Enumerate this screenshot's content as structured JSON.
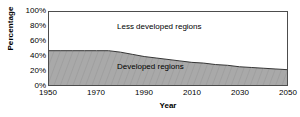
{
  "chart_data": {
    "type": "area",
    "title": "",
    "subtitle": "",
    "xlabel": "Year",
    "ylabel": "Percentage",
    "xlim": [
      1950,
      2050
    ],
    "ylim": [
      0,
      100
    ],
    "grid": false,
    "legend_position": "inside-plot-annotations",
    "stacked": true,
    "x": [
      1950,
      1955,
      1960,
      1965,
      1970,
      1975,
      1980,
      1985,
      1990,
      1995,
      2000,
      2005,
      2010,
      2015,
      2020,
      2025,
      2030,
      2035,
      2040,
      2045,
      2050
    ],
    "series": [
      {
        "name": "Developed regions",
        "fill": "#a9a9a9",
        "values": [
          47,
          47,
          47,
          47,
          47,
          47,
          45,
          42,
          39,
          37,
          35,
          33,
          31,
          30,
          28,
          27,
          25,
          24,
          23,
          22,
          21
        ]
      },
      {
        "name": "Less developed regions",
        "fill": "#ffffff",
        "values": [
          53,
          53,
          53,
          53,
          53,
          53,
          55,
          58,
          61,
          63,
          65,
          67,
          69,
          70,
          72,
          73,
          75,
          76,
          77,
          78,
          79
        ]
      }
    ],
    "annotations": [
      {
        "text": "Less developed regions",
        "series": "Less developed regions"
      },
      {
        "text": "Developed regions",
        "series": "Developed regions"
      }
    ],
    "y_ticks": [
      {
        "value": 100,
        "label": "100%"
      },
      {
        "value": 80,
        "label": "80%"
      },
      {
        "value": 60,
        "label": "60%"
      },
      {
        "value": 40,
        "label": "40%"
      },
      {
        "value": 20,
        "label": "20%"
      },
      {
        "value": 0,
        "label": "0%"
      }
    ],
    "x_ticks": [
      {
        "value": 1950,
        "label": "1950"
      },
      {
        "value": 1970,
        "label": "1970"
      },
      {
        "value": 1990,
        "label": "1990"
      },
      {
        "value": 2010,
        "label": "2010"
      },
      {
        "value": 2030,
        "label": "2030"
      },
      {
        "value": 2050,
        "label": "2050"
      }
    ],
    "colors": {
      "developed_fill": "#a9a9a9",
      "less_developed_fill": "#ffffff",
      "axis": "#4d4d4d",
      "curve": "#333333",
      "text": "#000000"
    }
  }
}
